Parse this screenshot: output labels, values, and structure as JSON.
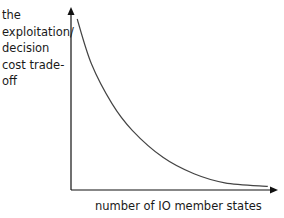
{
  "chart_data": {
    "type": "line",
    "title": "",
    "xlabel": "number of IO member states",
    "ylabel": "the exploitation/ decision cost trade-off",
    "ylabel_lines": [
      "the",
      "exploitation/",
      "decision",
      "cost trade-",
      "off"
    ],
    "x_ticks": [],
    "y_ticks": [],
    "grid": false,
    "legend": null,
    "series": [
      {
        "name": "exploitation/decision cost trade-off",
        "shape": "decreasing convex curve",
        "points_normalized": [
          [
            0.03,
            0.95
          ],
          [
            0.1,
            0.7
          ],
          [
            0.2,
            0.48
          ],
          [
            0.3,
            0.33
          ],
          [
            0.45,
            0.18
          ],
          [
            0.6,
            0.09
          ],
          [
            0.75,
            0.04
          ],
          [
            0.96,
            0.02
          ]
        ]
      }
    ],
    "axis_ranges": {
      "x": [
        0,
        1
      ],
      "y": [
        0,
        1
      ]
    },
    "colors": {
      "axis": "#111111",
      "curve": "#444444"
    }
  }
}
